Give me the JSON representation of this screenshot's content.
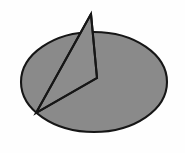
{
  "figure": {
    "background_color": "#fefefe",
    "width": 185,
    "height": 153,
    "title": "",
    "caption": ""
  },
  "style": {
    "fill_color": "#8a8a8a",
    "outline_color": "#161616",
    "outline_width": 2.1,
    "exploded_fill_color": "#8c8c8c"
  },
  "geometry": {
    "ellipse_center_x": 94,
    "ellipse_center_y": 82,
    "ellipse_radius_x": 74,
    "ellipse_radius_y": 51,
    "pie_center_x": 97,
    "pie_center_y": 78,
    "explode_apex_x": 91,
    "explode_apex_y": 14,
    "lower_left_vertex_x": 36,
    "lower_left_vertex_y": 113
  },
  "chart_data": {
    "type": "pie",
    "title": "",
    "subtitle": "",
    "xlabel": "",
    "ylabel": "",
    "legend_position": "none",
    "grid": false,
    "labels": [
      "Slice 1",
      "Slice 2"
    ],
    "values": [
      22,
      78
    ],
    "percentages": [
      "22%",
      "78%"
    ],
    "colors": [
      "#8c8c8c",
      "#8a8a8a"
    ],
    "exploded": [
      true,
      false
    ],
    "start_angle_deg": 90,
    "slice_angles_deg": [
      79,
      281
    ],
    "annotations": []
  },
  "elements": {
    "pie_body_name": "pie-remaining-slice",
    "exploded_slice_name": "pie-exploded-slice",
    "divider_name": "pie-slice-divider"
  }
}
